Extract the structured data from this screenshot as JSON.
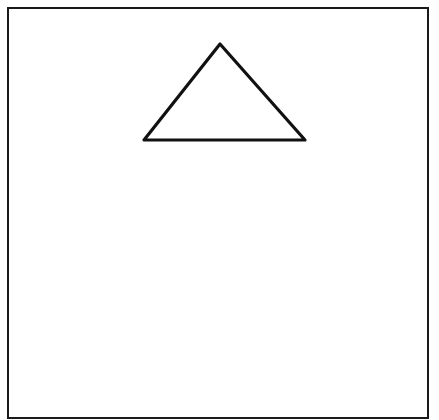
{
  "diagram": {
    "canvas": {
      "width": 439,
      "height": 420,
      "background": "#ffffff"
    },
    "frame": {
      "shape": "rectangle",
      "x": 8,
      "y": 8,
      "width": 420,
      "height": 410,
      "stroke": "#1a1a1a",
      "stroke_width": 2,
      "fill": "none"
    },
    "triangle": {
      "shape": "triangle",
      "vertices": [
        [
          220,
          44
        ],
        [
          305,
          140
        ],
        [
          144,
          140
        ]
      ],
      "stroke": "#111111",
      "stroke_width": 3.2,
      "fill": "#ffffff",
      "corner_style": "rounded"
    }
  }
}
